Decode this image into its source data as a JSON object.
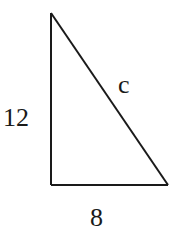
{
  "diagram": {
    "type": "right-triangle",
    "labels": {
      "vertical_leg": "12",
      "horizontal_leg": "8",
      "hypotenuse": "c"
    },
    "colors": {
      "stroke": "#1a1a1a",
      "background": "#ffffff"
    }
  }
}
